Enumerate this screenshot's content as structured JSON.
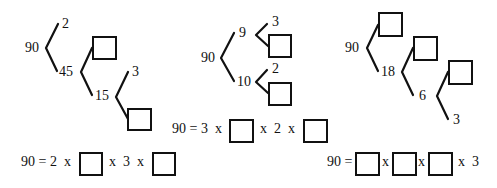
{
  "colors": {
    "ink": "#111111",
    "background": "#ffffff"
  },
  "trees": [
    {
      "root": "90",
      "nodes": {
        "n90": "90",
        "n2": "2",
        "n45": "45",
        "n15": "15",
        "n3": "3"
      },
      "blanks": 2,
      "equation": {
        "prefix": "90 = 2  x",
        "middle": "x  3  x",
        "suffix": ""
      }
    },
    {
      "root": "90",
      "nodes": {
        "n90": "90",
        "n9": "9",
        "n10": "10",
        "n3": "3",
        "n2": "2"
      },
      "blanks": 2,
      "equation": {
        "prefix": "90 = 3  x",
        "middle": "x  2  x",
        "suffix": ""
      }
    },
    {
      "root": "90",
      "nodes": {
        "n90": "90",
        "n18": "18",
        "n6": "6",
        "n3": "3"
      },
      "blanks": 3,
      "equation": {
        "prefix": "90 =",
        "sep1": "x",
        "sep2": "x",
        "suffix": "x  3"
      }
    }
  ]
}
